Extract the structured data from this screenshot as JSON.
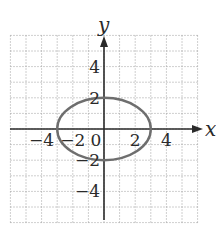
{
  "chart_data": {
    "type": "line",
    "title": "",
    "xlabel": "x",
    "ylabel": "y",
    "xlim": [
      -6,
      6
    ],
    "ylim": [
      -6,
      6
    ],
    "grid": true,
    "grid_style": "dotted",
    "x_ticks": [
      {
        "value": -4,
        "label": "−4"
      },
      {
        "value": -2,
        "label": "−2"
      },
      {
        "value": 0,
        "label": "0"
      },
      {
        "value": 2,
        "label": "2"
      },
      {
        "value": 4,
        "label": "4"
      }
    ],
    "y_ticks": [
      {
        "value": 4,
        "label": "4"
      },
      {
        "value": 2,
        "label": "2"
      },
      {
        "value": -2,
        "label": "−2"
      },
      {
        "value": -4,
        "label": "−4"
      }
    ],
    "series": [
      {
        "name": "ellipse",
        "equation": "x^2/9 + y^2/4 = 1",
        "center": [
          0,
          0
        ],
        "semi_axis_x": 3,
        "semi_axis_y": 2,
        "color": "#6e6e6e"
      }
    ]
  },
  "labels": {
    "x_axis": "x",
    "y_axis": "y"
  },
  "colors": {
    "axis": "#2a2a2a",
    "grid": "#9a9a9a",
    "curve": "#6e6e6e"
  }
}
